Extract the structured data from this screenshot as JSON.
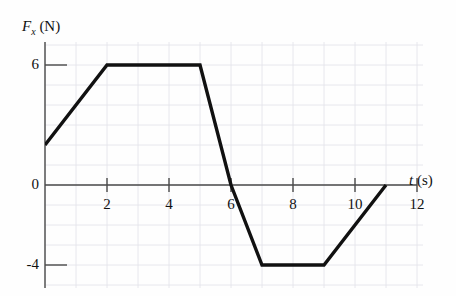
{
  "figure": {
    "background_color": "#fefefe",
    "curve_color": "#111111",
    "axis_color": "#4a4a4a",
    "grid_color": "#e2e2ea"
  },
  "axes": {
    "y_title_main": "F",
    "y_title_sub": "x",
    "y_title_unit": " (N)",
    "x_title_main": "t",
    "x_title_unit": " (s)"
  },
  "chart_data": {
    "type": "line",
    "title": "",
    "subtitle": "",
    "xlabel": "t (s)",
    "ylabel": "Fx (N)",
    "xlim": [
      0,
      12
    ],
    "ylim": [
      -5,
      7
    ],
    "grid": true,
    "grid_x_step": 1,
    "grid_y_step": 1,
    "legend": "none",
    "x_ticks": [
      2,
      4,
      6,
      8,
      10,
      12
    ],
    "x_tick_labels": [
      "2",
      "4",
      "6",
      "8",
      "10",
      "12"
    ],
    "y_ticks": [
      6,
      0,
      -4
    ],
    "y_tick_labels": [
      "6",
      "0",
      "-4"
    ],
    "series": [
      {
        "name": "Fx",
        "x": [
          0,
          2,
          5,
          6,
          7,
          9,
          11
        ],
        "values": [
          2,
          6,
          6,
          0,
          -4,
          -4,
          0
        ]
      }
    ],
    "annotations": []
  }
}
